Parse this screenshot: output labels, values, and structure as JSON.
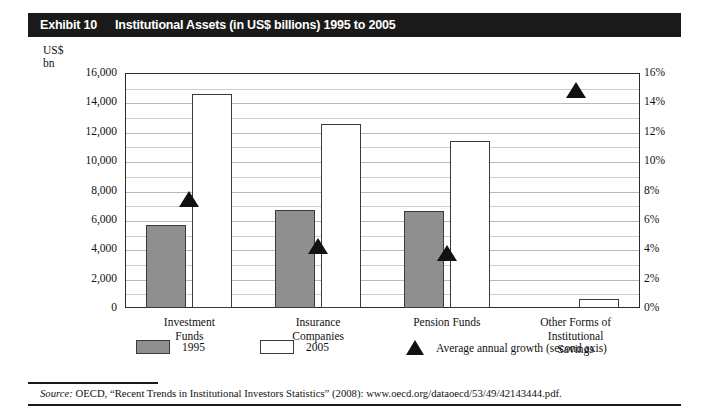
{
  "exhibit": {
    "label": "Exhibit 10",
    "title": "Institutional Assets (in US$ billions) 1995 to 2005"
  },
  "axis_caption": {
    "line1": "US$",
    "line2": "bn"
  },
  "source": {
    "prefix": "Source:",
    "text": " OECD, “Recent Trends in Institutional Investors Statistics” (2008): www.oecd.org/dataoecd/53/49/42143444.pdf."
  },
  "legend": {
    "items": [
      {
        "key": "1995",
        "label": "1995",
        "type": "filled-swatch"
      },
      {
        "key": "2005",
        "label": "2005",
        "type": "hollow-swatch"
      },
      {
        "key": "growth",
        "label": "Average annual growth (second axis)",
        "type": "triangle"
      }
    ]
  },
  "colors": {
    "bar_1995_fill": "#8f8f8f",
    "bar_2005_fill": "#ffffff",
    "bar_stroke": "#3a3a3a",
    "marker": "#111111",
    "gridline": "#b9b9b9",
    "header_bg": "#1a1a1a",
    "header_fg": "#ffffff"
  },
  "chart_data": {
    "type": "bar",
    "title": "Institutional Assets (in US$ billions) 1995 to 2005",
    "xlabel": "",
    "ylabel": "US$ bn",
    "y2label": "Average annual growth",
    "grid": true,
    "legend_position": "bottom",
    "ylim": [
      0,
      16000
    ],
    "y2lim": [
      0,
      16
    ],
    "yticks": [
      "0",
      "2,000",
      "4,000",
      "6,000",
      "8,000",
      "10,000",
      "12,000",
      "14,000",
      "16,000"
    ],
    "ytick_values": [
      0,
      2000,
      4000,
      6000,
      8000,
      10000,
      12000,
      14000,
      16000
    ],
    "y2ticks": [
      "0%",
      "2%",
      "4%",
      "6%",
      "8%",
      "10%",
      "12%",
      "14%",
      "16%"
    ],
    "y2tick_values": [
      0,
      2,
      4,
      6,
      8,
      10,
      12,
      14,
      16
    ],
    "categories": [
      "Investment Funds",
      "Insurance Companies",
      "Pension Funds",
      "Other Forms of Institutional Savings"
    ],
    "category_label_lines": [
      [
        "Investment",
        "Funds"
      ],
      [
        "Insurance",
        "Companies"
      ],
      [
        "Pension Funds"
      ],
      [
        "Other Forms of",
        "Institutional",
        "Savings"
      ]
    ],
    "series": [
      {
        "name": "1995",
        "values": [
          5650,
          6650,
          6600,
          0
        ]
      },
      {
        "name": "2005",
        "values": [
          14600,
          12500,
          11400,
          600
        ]
      },
      {
        "name": "Average annual growth (second axis)",
        "axis": "secondary",
        "unit": "%",
        "values": [
          8.0,
          4.8,
          4.3,
          15.4
        ]
      }
    ]
  }
}
